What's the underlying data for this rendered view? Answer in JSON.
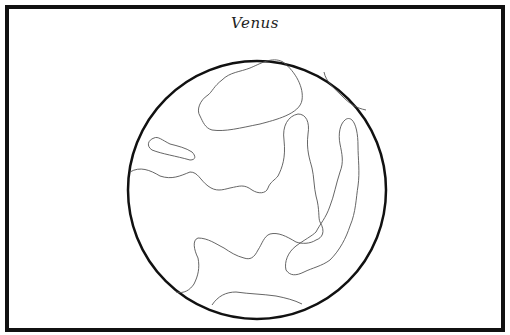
{
  "page": {
    "title": "Venus"
  },
  "colors": {
    "outline": "#111111",
    "detail_lines": "#555555",
    "background": "#ffffff"
  }
}
